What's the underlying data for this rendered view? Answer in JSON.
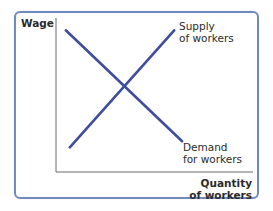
{
  "chart_data": {
    "type": "line",
    "title": "",
    "xlabel": "Quantity of workers",
    "ylabel": "Wage",
    "xlim": [
      0,
      10
    ],
    "ylim": [
      0,
      10
    ],
    "grid": false,
    "series": [
      {
        "name": "Supply of workers",
        "label_lines": [
          "Supply",
          "of workers"
        ],
        "x": [
          0.7,
          6.0
        ],
        "y": [
          1.6,
          9.2
        ],
        "color": "#3f4d9e"
      },
      {
        "name": "Demand for workers",
        "label_lines": [
          "Demand",
          "for workers"
        ],
        "x": [
          0.5,
          6.4
        ],
        "y": [
          9.2,
          2.0
        ],
        "color": "#3f4d9e"
      }
    ],
    "axis_labels": {
      "y": "Wage",
      "x_lines": [
        "Quantity",
        "of workers"
      ]
    }
  },
  "colors": {
    "frame": "#6f8bbd",
    "axis": "#6b6b6b",
    "curve": "#3f4d9e",
    "text": "#2b2b2b"
  }
}
